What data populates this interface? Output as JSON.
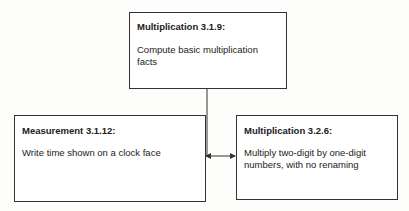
{
  "diagram": {
    "nodes": [
      {
        "id": "top",
        "title": "Multiplication 3.1.9:",
        "description": "Compute basic multiplication facts"
      },
      {
        "id": "left",
        "title": "Measurement 3.1.12:",
        "description": "Write time shown on a clock face"
      },
      {
        "id": "right",
        "title": "Multiplication 3.2.6:",
        "description": "Multiply two-digit by one-digit numbers, with no renaming"
      }
    ],
    "edges": [
      {
        "from": "top",
        "to": "left",
        "arrow": "end"
      },
      {
        "from": "top",
        "to": "right",
        "arrow": "end"
      }
    ],
    "colors": {
      "line": "#333333",
      "background": "#fdfdfc"
    }
  }
}
